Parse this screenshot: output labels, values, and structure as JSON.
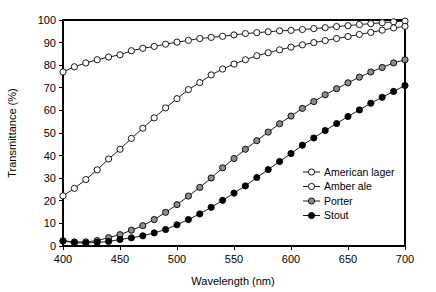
{
  "chart_data": {
    "type": "line",
    "title": "",
    "xlabel": "Wavelength (nm)",
    "ylabel": "Transmittance (%)",
    "xlim": [
      400,
      700
    ],
    "ylim": [
      0,
      100
    ],
    "xticks": [
      400,
      450,
      500,
      550,
      600,
      650,
      700
    ],
    "yticks": [
      0,
      10,
      20,
      30,
      40,
      50,
      60,
      70,
      80,
      90,
      100
    ],
    "grid": false,
    "legend_position": "lower right",
    "x": [
      400,
      410,
      420,
      430,
      440,
      450,
      460,
      470,
      480,
      490,
      500,
      510,
      520,
      530,
      540,
      550,
      560,
      570,
      580,
      590,
      600,
      610,
      620,
      630,
      640,
      650,
      660,
      670,
      680,
      690,
      700
    ],
    "series": [
      {
        "name": "American lager",
        "marker": "open-circle",
        "marker_fill": "#ffffff",
        "marker_edge": "#000000",
        "values": [
          77.0,
          79.3,
          81.0,
          82.4,
          83.6,
          84.6,
          86.4,
          87.5,
          88.3,
          89.3,
          90.2,
          91.0,
          91.8,
          92.3,
          92.8,
          93.4,
          94.0,
          94.4,
          94.8,
          95.2,
          95.4,
          95.8,
          96.2,
          96.6,
          97.1,
          97.5,
          98.0,
          98.4,
          98.8,
          99.2,
          99.5
        ]
      },
      {
        "name": "Amber ale",
        "marker": "open-circle",
        "marker_fill": "#ffffff",
        "marker_edge": "#000000",
        "values": [
          22.2,
          25.5,
          29.4,
          33.7,
          38.5,
          42.8,
          47.6,
          52.1,
          56.7,
          61.1,
          65.2,
          69.2,
          72.3,
          75.7,
          78.3,
          80.5,
          82.4,
          84.2,
          85.5,
          86.8,
          88.0,
          89.0,
          90.0,
          90.9,
          91.8,
          92.7,
          93.6,
          94.5,
          95.5,
          96.5,
          97.2
        ]
      },
      {
        "name": "Porter",
        "marker": "filled-circle",
        "marker_fill": "#8c8c8c",
        "marker_edge": "#000000",
        "values": [
          2.3,
          1.8,
          1.8,
          2.4,
          3.7,
          5.0,
          7.0,
          9.0,
          11.7,
          14.9,
          18.3,
          22.1,
          25.9,
          30.1,
          34.6,
          38.7,
          42.8,
          46.6,
          50.4,
          54.1,
          57.5,
          60.9,
          63.9,
          66.9,
          69.6,
          72.2,
          74.7,
          77.0,
          79.0,
          81.0,
          82.4
        ]
      },
      {
        "name": "Stout",
        "marker": "filled-circle",
        "marker_fill": "#000000",
        "marker_edge": "#000000",
        "values": [
          2.2,
          1.5,
          1.3,
          1.6,
          2.0,
          2.9,
          3.6,
          4.5,
          5.8,
          7.3,
          9.4,
          11.7,
          14.2,
          17.1,
          20.2,
          23.4,
          26.6,
          30.3,
          33.8,
          37.4,
          40.9,
          44.6,
          47.8,
          51.1,
          54.2,
          57.3,
          60.2,
          63.2,
          65.8,
          68.4,
          71.0
        ]
      }
    ]
  },
  "axes": {
    "x_tick_labels": [
      "400",
      "450",
      "500",
      "550",
      "600",
      "650",
      "700"
    ],
    "y_tick_labels": [
      "0",
      "10",
      "20",
      "30",
      "40",
      "50",
      "60",
      "70",
      "80",
      "90",
      "100"
    ],
    "x_axis_title": "Wavelength (nm)",
    "y_axis_title": "Transmittance (%)"
  },
  "legend": {
    "entries": [
      {
        "label": "American lager"
      },
      {
        "label": "Amber ale"
      },
      {
        "label": "Porter"
      },
      {
        "label": "Stout"
      }
    ]
  }
}
